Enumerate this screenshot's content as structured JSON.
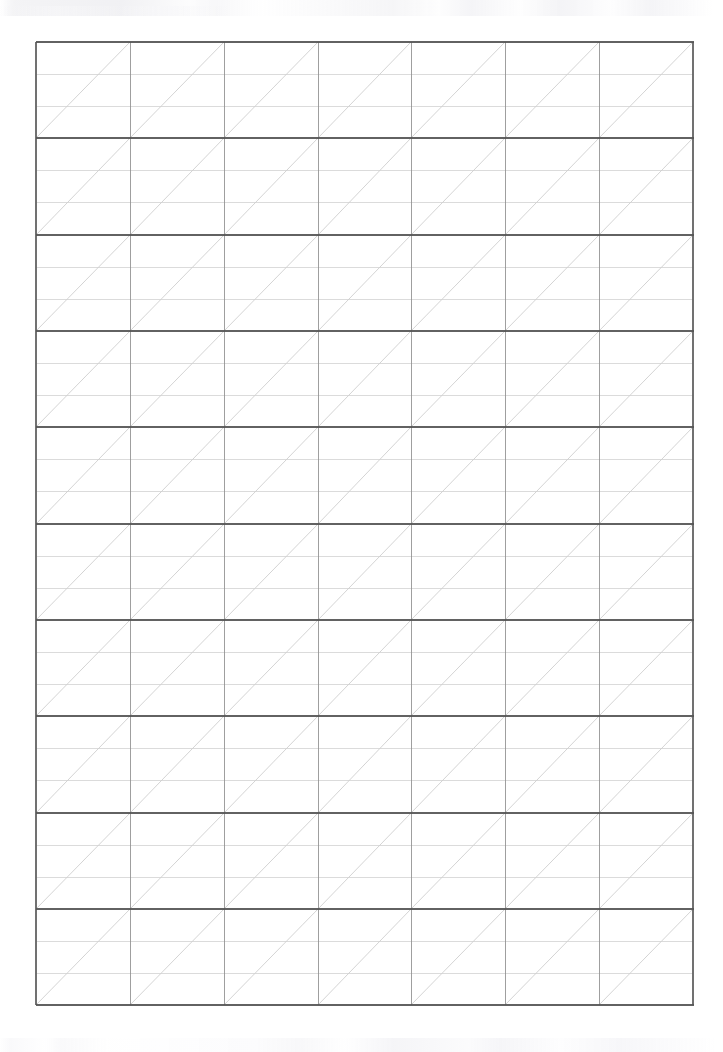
{
  "document": {
    "kind": "scanned-ruled-grid-sheet",
    "page_label": "",
    "background_color": "#ffffff",
    "visible_text": "",
    "top_edge_artifact": "faint illegible scan ghosting along the top edge",
    "bottom_edge_artifact": "faint illegible scan ghosting along the bottom edge"
  },
  "chart_data": {
    "type": "table",
    "title": "",
    "subtitle": "",
    "xlabel": "",
    "ylabel": "",
    "grid": true,
    "legend": "none",
    "categories": [],
    "values": [],
    "geometry": {
      "page_width": 723,
      "page_height": 1052,
      "grid_left": 36,
      "grid_top": 42,
      "grid_right": 693,
      "grid_bottom": 1005,
      "columns": 7,
      "major_rows": 10,
      "sub_rows_per_major_row": 3,
      "column_width": 93.86,
      "major_row_height": 96.3,
      "sub_row_height": 32.1,
      "vertical_line_x": [
        36,
        130,
        224,
        318,
        411,
        505,
        599,
        693
      ],
      "major_row_y": [
        42,
        138,
        235,
        331,
        427,
        524,
        620,
        716,
        813,
        909,
        1005
      ],
      "diagonal_direction": "bottom-left to top-right",
      "diagonals_per_cell": 1,
      "total_cells": 70
    },
    "colors": {
      "page_background": "#ffffff",
      "major_horizontal_line": "#555555",
      "vertical_line": "#8f8f8f",
      "sub_horizontal_line": "#cfcfcf",
      "diagonal_line": "#c4c4c4",
      "outer_frame_line": "#6a6a6a"
    },
    "line_widths": {
      "major_horizontal_line": 1.6,
      "vertical_line": 0.9,
      "sub_horizontal_line": 0.8,
      "diagonal_line": 0.8
    }
  }
}
